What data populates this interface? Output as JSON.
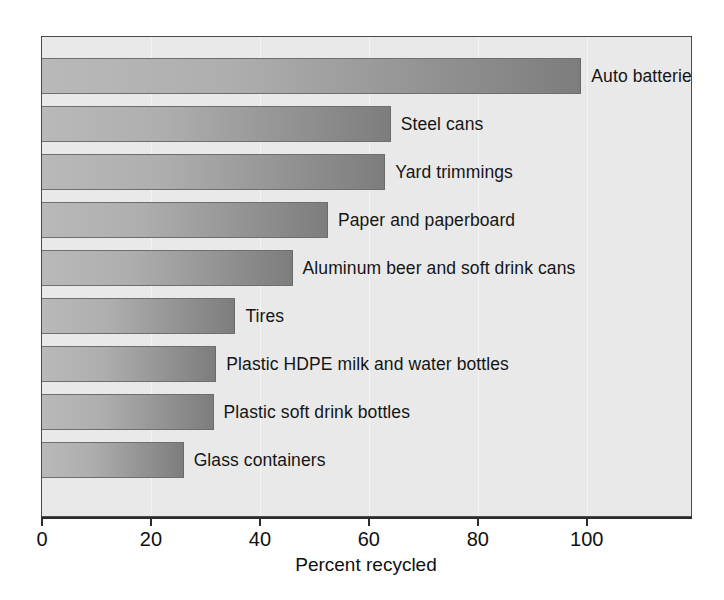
{
  "chart_data": {
    "type": "bar",
    "orientation": "horizontal",
    "title": "",
    "xlabel": "Percent recycled",
    "ylabel": "",
    "xlim": [
      0,
      119.5
    ],
    "xticks": [
      0,
      20,
      40,
      60,
      80,
      100
    ],
    "xtick_labels": [
      "0",
      "20",
      "40",
      "60",
      "80",
      "100"
    ],
    "grid": "vertical",
    "legend": "none",
    "categories": [
      "Auto batteries",
      "Steel cans",
      "Yard trimmings",
      "Paper and paperboard",
      "Aluminum beer and soft drink cans",
      "Tires",
      "Plastic HDPE milk and water bottles",
      "Plastic soft drink bottles",
      "Glass containers"
    ],
    "values": [
      99,
      64,
      63,
      52.5,
      46,
      35.5,
      32,
      31.5,
      26
    ],
    "bars": [
      {
        "label": "Auto batteries",
        "value": 99,
        "wrap": true
      },
      {
        "label": "Steel cans",
        "value": 64,
        "wrap": false
      },
      {
        "label": "Yard trimmings",
        "value": 63,
        "wrap": false
      },
      {
        "label": "Paper and paperboard",
        "value": 52.5,
        "wrap": false
      },
      {
        "label": "Aluminum beer and soft drink cans",
        "value": 46,
        "wrap": false
      },
      {
        "label": "Tires",
        "value": 35.5,
        "wrap": false
      },
      {
        "label": "Plastic HDPE milk and water bottles",
        "value": 32,
        "wrap": false
      },
      {
        "label": "Plastic soft drink bottles",
        "value": 31.5,
        "wrap": false
      },
      {
        "label": "Glass containers",
        "value": 26,
        "wrap": false
      }
    ],
    "colors": {
      "plot_background": "#e9e9e9",
      "bar_gradient_start": "#b9b9b9",
      "bar_gradient_end": "#7d7d7d",
      "bar_border": "#6e6e6e",
      "axis": "#2b2b2b",
      "gridline": "#f4f4f4",
      "text": "#101010",
      "page_background": "#ffffff"
    }
  }
}
